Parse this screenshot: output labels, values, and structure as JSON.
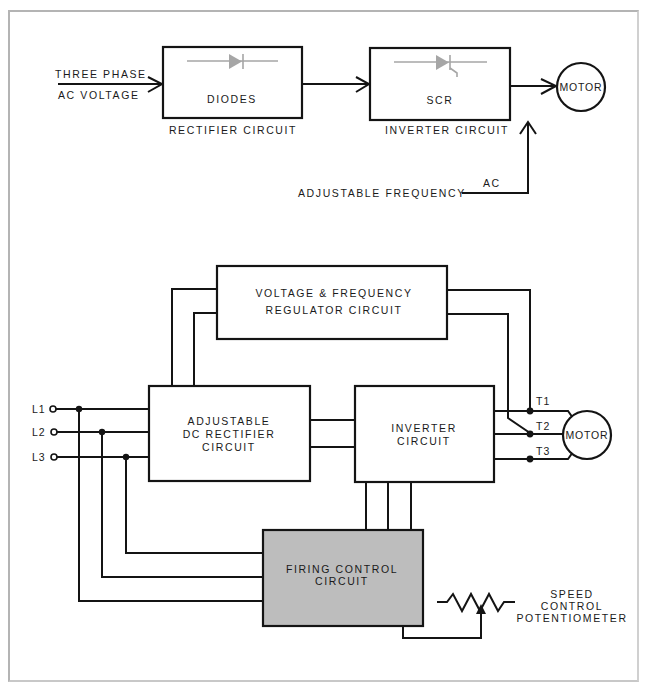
{
  "top_diagram": {
    "input_label_line1": "THREE PHASE",
    "input_label_line2": "AC VOLTAGE",
    "rectifier_box_label": "DIODES",
    "rectifier_caption": "RECTIFIER CIRCUIT",
    "inverter_box_label": "SCR",
    "inverter_caption": "INVERTER CIRCUIT",
    "motor_label": "MOTOR",
    "output_label_prefix": "ADJUSTABLE FREQUENCY",
    "output_label_suffix": "AC",
    "rectifier_symbol": "diode-symbol",
    "inverter_symbol": "scr-symbol"
  },
  "bottom_diagram": {
    "regulator_line1": "VOLTAGE & FREQUENCY",
    "regulator_line2": "REGULATOR CIRCUIT",
    "dc_rectifier_line1": "ADJUSTABLE",
    "dc_rectifier_line2": "DC RECTIFIER",
    "dc_rectifier_line3": "CIRCUIT",
    "inverter_line1": "INVERTER",
    "inverter_line2": "CIRCUIT",
    "firing_line1": "FIRING CONTROL",
    "firing_line2": "CIRCUIT",
    "motor_label": "MOTOR",
    "input_lines": [
      "L1",
      "L2",
      "L3"
    ],
    "output_terminals": [
      "T1",
      "T2",
      "T3"
    ],
    "potentiometer_line1": "SPEED",
    "potentiometer_line2": "CONTROL",
    "potentiometer_line3": "POTENTIOMETER",
    "potentiometer_symbol": "variable-resistor-symbol"
  },
  "colors": {
    "line": "#141414",
    "firing_box_fill": "#bdbdbd",
    "symbol_grey": "#a6a6a6",
    "frame": "#b4b4b4"
  }
}
